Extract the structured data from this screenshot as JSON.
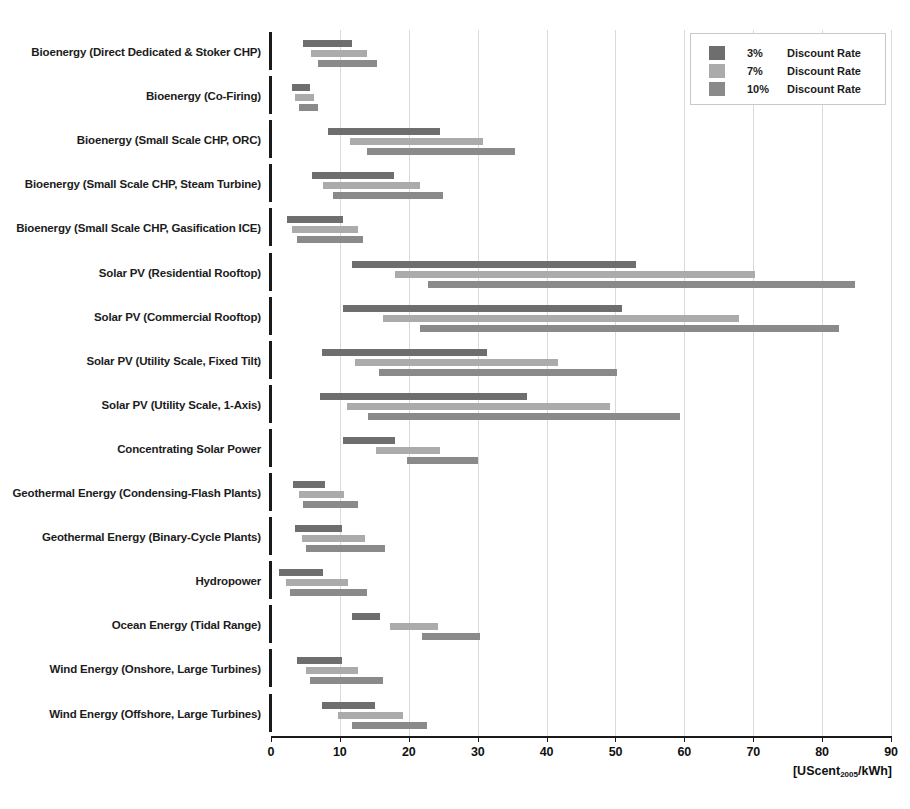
{
  "chart_data": {
    "type": "bar",
    "subtype": "floating-range-bar",
    "title": "",
    "xlabel": "[UScent2005/kWh]",
    "ylabel": "",
    "xlim": [
      0,
      90
    ],
    "xticks": [
      0,
      10,
      20,
      30,
      40,
      50,
      60,
      70,
      80,
      90
    ],
    "grid": "vertical",
    "legend_position": "top-right",
    "categories": [
      "Bioenergy (Direct Dedicated & Stoker CHP)",
      "Bioenergy (Co-Firing)",
      "Bioenergy (Small Scale CHP, ORC)",
      "Bioenergy (Small Scale CHP, Steam Turbine)",
      "Bioenergy (Small Scale CHP, Gasification ICE)",
      "Solar PV (Residential Rooftop)",
      "Solar PV (Commercial Rooftop)",
      "Solar PV (Utility Scale, Fixed Tilt)",
      "Solar PV (Utility Scale, 1-Axis)",
      "Concentrating Solar Power",
      "Geothermal Energy (Condensing-Flash Plants)",
      "Geothermal Energy (Binary-Cycle Plants)",
      "Hydropower",
      "Ocean Energy (Tidal Range)",
      "Wind Energy (Onshore, Large Turbines)",
      "Wind Energy (Offshore, Large Turbines)"
    ],
    "series": [
      {
        "name": "3% Discount Rate",
        "color": "#6e6e6e",
        "ranges": [
          [
            4.6,
            11.8
          ],
          [
            3.0,
            5.6
          ],
          [
            8.3,
            24.5
          ],
          [
            5.9,
            17.8
          ],
          [
            2.3,
            10.5
          ],
          [
            11.8,
            53.0
          ],
          [
            10.5,
            51.0
          ],
          [
            7.4,
            31.3
          ],
          [
            7.1,
            37.2
          ],
          [
            10.5,
            18.0
          ],
          [
            3.2,
            7.8
          ],
          [
            3.5,
            10.3
          ],
          [
            1.2,
            7.5
          ],
          [
            11.8,
            15.8
          ],
          [
            3.8,
            10.3
          ],
          [
            7.4,
            15.1
          ]
        ]
      },
      {
        "name": "7% Discount Rate",
        "color": "#ababab",
        "ranges": [
          [
            5.8,
            14.0
          ],
          [
            3.5,
            6.2
          ],
          [
            11.5,
            30.8
          ],
          [
            7.6,
            21.6
          ],
          [
            3.1,
            12.6
          ],
          [
            18.0,
            70.3
          ],
          [
            16.3,
            68.0
          ],
          [
            12.2,
            41.6
          ],
          [
            11.0,
            49.2
          ],
          [
            15.2,
            24.5
          ],
          [
            4.1,
            10.6
          ],
          [
            4.5,
            13.6
          ],
          [
            2.2,
            11.2
          ],
          [
            17.3,
            24.2
          ],
          [
            5.1,
            12.6
          ],
          [
            9.7,
            19.2
          ]
        ]
      },
      {
        "name": "10% Discount Rate",
        "color": "#8a8a8a",
        "ranges": [
          [
            6.8,
            15.4
          ],
          [
            4.0,
            6.8
          ],
          [
            14.0,
            35.4
          ],
          [
            9.0,
            25.0
          ],
          [
            3.8,
            13.3
          ],
          [
            22.8,
            84.8
          ],
          [
            21.7,
            82.5
          ],
          [
            15.7,
            50.2
          ],
          [
            14.1,
            59.4
          ],
          [
            19.7,
            30.0
          ],
          [
            4.6,
            12.6
          ],
          [
            5.1,
            16.5
          ],
          [
            2.8,
            14.0
          ],
          [
            21.9,
            30.3
          ],
          [
            5.7,
            16.3
          ],
          [
            11.8,
            22.7
          ]
        ]
      }
    ]
  },
  "axis": {
    "tick_labels": [
      "0",
      "10",
      "20",
      "30",
      "40",
      "50",
      "60",
      "70",
      "80",
      "90"
    ],
    "unit_prefix": "[UScent",
    "unit_subscript": "2005",
    "unit_suffix": "/kWh]"
  },
  "legend": {
    "entries": [
      {
        "pct": "3%",
        "label": "Discount Rate",
        "color": "#6e6e6e"
      },
      {
        "pct": "7%",
        "label": "Discount Rate",
        "color": "#ababab"
      },
      {
        "pct": "10%",
        "label": "Discount Rate",
        "color": "#8a8a8a"
      }
    ]
  }
}
